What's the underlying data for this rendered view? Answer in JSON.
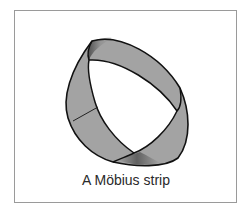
{
  "figure": {
    "caption": "A Möbius strip",
    "colors": {
      "strip_fill": "#a3a3a3",
      "strip_outline": "#111111",
      "frame_border": "#9a9a9a",
      "background": "#ffffff",
      "caption_text": "#2a2a2a"
    }
  }
}
